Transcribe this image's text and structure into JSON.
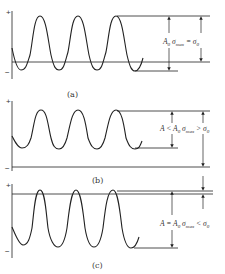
{
  "panels": [
    {
      "id": "a",
      "caption": "(a)",
      "plus_sign": "+",
      "minus_sign": "−",
      "label": "A₀ σmax = σ₀",
      "label_parts": {
        "pre": "A",
        "sub0": "0",
        "sigma": " σ",
        "subMax": "max",
        "eq": " = σ",
        "sub1": "0"
      }
    },
    {
      "id": "b",
      "caption": "(b)",
      "plus_sign": "+",
      "minus_sign": "−",
      "label": "A < A₀ σmax > σ₀",
      "label_parts": {
        "pre": "A < A",
        "sub0": "0",
        "sigma": " σ",
        "subMax": "max",
        "eq": " > σ",
        "sub1": "0"
      }
    },
    {
      "id": "c",
      "caption": "(c)",
      "plus_sign": "+",
      "minus_sign": "−",
      "label": "A = A₀ σmax < σ₀",
      "label_parts": {
        "pre": "A = A",
        "sub0": "0",
        "sigma": " σ",
        "subMax": "max",
        "eq": " < σ",
        "sub1": "0"
      }
    }
  ],
  "colors": {
    "line": "#222222",
    "text": "#333333",
    "background": "#ffffff"
  }
}
